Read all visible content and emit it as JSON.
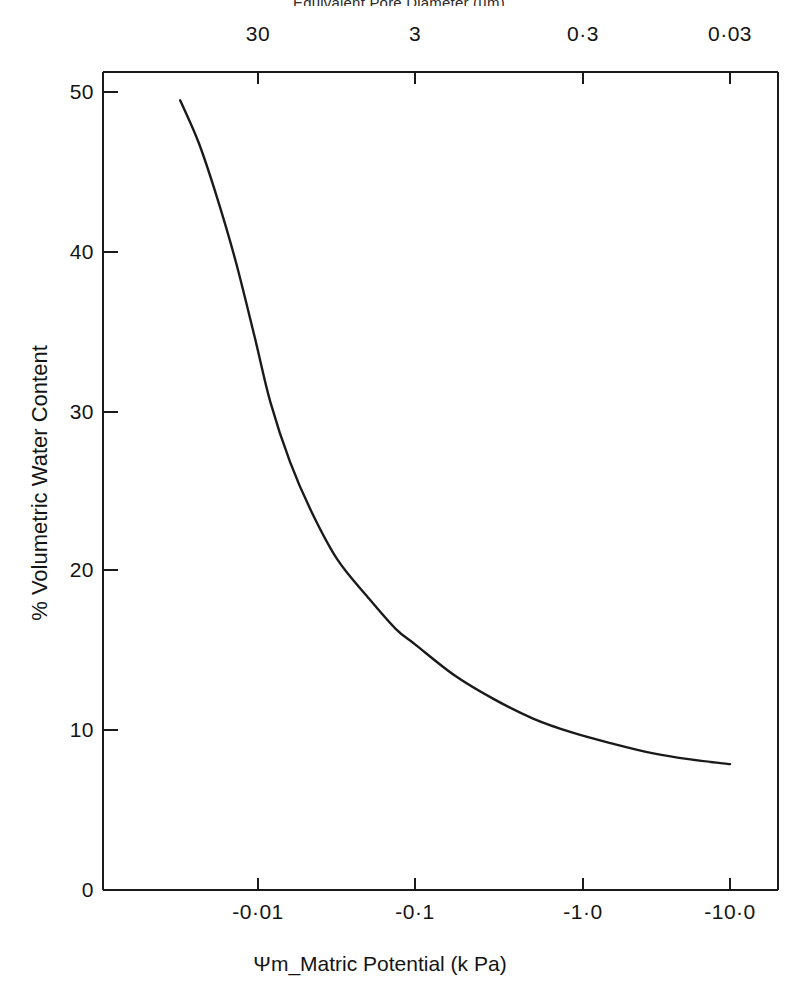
{
  "figure": {
    "top_axis_title": "Equivalent Pore Diameter (µm)",
    "x_axis_title": "Ψm_Matric Potential (k Pa)",
    "y_axis_title": "% Volumetric Water Content",
    "line_color": "#1a1a1a",
    "axis_color": "#1a1a1a",
    "background_color": "#ffffff"
  },
  "chart_data": {
    "type": "line",
    "title": "Equivalent Pore Diameter (µm)",
    "xlabel": "Ψm_Matric Potential (k Pa)",
    "ylabel": "% Volumetric Water Content",
    "grid": false,
    "legend": null,
    "x_scale": "log",
    "x_tick_labels": [
      "-0·01",
      "-0·1",
      "-1·0",
      "-10·0"
    ],
    "x_tick_values": [
      -0.01,
      -0.1,
      -1.0,
      -10.0
    ],
    "x_tick_px": [
      258,
      415,
      583,
      730
    ],
    "top_axis_tick_labels": [
      "30",
      "3",
      "0·3",
      "0·03"
    ],
    "top_axis_tick_values": [
      30,
      3,
      0.3,
      0.03
    ],
    "top_axis_tick_px": [
      258,
      415,
      583,
      730
    ],
    "ylim": [
      0,
      52
    ],
    "y_tick_labels": [
      "0",
      "10",
      "20",
      "30",
      "40",
      "50"
    ],
    "y_tick_values": [
      0,
      10,
      20,
      30,
      40,
      50
    ],
    "series": [
      {
        "name": "Soil water retention curve",
        "points": [
          {
            "x": -0.0032,
            "y": 50.2
          },
          {
            "x": -0.0042,
            "y": 47.5
          },
          {
            "x": -0.0055,
            "y": 44.0
          },
          {
            "x": -0.0072,
            "y": 40.0
          },
          {
            "x": -0.0095,
            "y": 35.2
          },
          {
            "x": -0.012,
            "y": 31.0
          },
          {
            "x": -0.016,
            "y": 27.2
          },
          {
            "x": -0.022,
            "y": 24.0
          },
          {
            "x": -0.032,
            "y": 21.0
          },
          {
            "x": -0.05,
            "y": 18.6
          },
          {
            "x": -0.075,
            "y": 16.6
          },
          {
            "x": -0.1,
            "y": 15.6
          },
          {
            "x": -0.18,
            "y": 13.6
          },
          {
            "x": -0.32,
            "y": 12.1
          },
          {
            "x": -0.56,
            "y": 10.9
          },
          {
            "x": -1.0,
            "y": 10.0
          },
          {
            "x": -1.8,
            "y": 9.3
          },
          {
            "x": -3.2,
            "y": 8.7
          },
          {
            "x": -5.6,
            "y": 8.3
          },
          {
            "x": -10.0,
            "y": 8.0
          }
        ]
      }
    ]
  },
  "plot_box": {
    "left_px": 103,
    "right_px": 778,
    "top_px": 72,
    "bottom_px": 890
  }
}
